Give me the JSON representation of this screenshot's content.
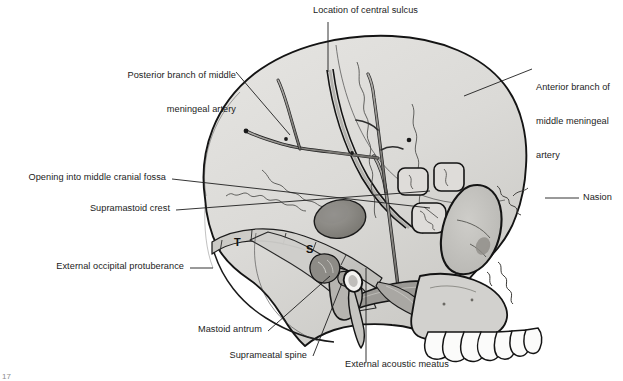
{
  "figure": {
    "width": 623,
    "height": 381,
    "background": "#ffffff",
    "caption_fragment": "17"
  },
  "palette": {
    "bone_fill": "#d9d8d5",
    "bone_fill_light": "#e4e3e0",
    "bone_fill_dark": "#c2c1bd",
    "outline": "#141414",
    "artery": "#9a9894",
    "artery_outline": "#2a2a2a",
    "leader_line": "#1e1e1e",
    "text": "#1b1b1b",
    "tooth_fill": "#fbfbfa",
    "shadow": "#a9a8a4"
  },
  "labels": [
    {
      "id": "location-of-central-sulcus",
      "text": "Location of central sulcus",
      "lines": [
        "Location of central sulcus"
      ],
      "align": "left",
      "x": 313,
      "y": 8,
      "leader": [
        [
          328,
          22
        ],
        [
          328,
          72
        ]
      ]
    },
    {
      "id": "posterior-branch-of-middle-meningeal-artery",
      "text": "Posterior branch of middle meningeal artery",
      "lines": [
        "Posterior branch of middle",
        "meningeal artery"
      ],
      "align": "right",
      "x": 99,
      "y": 50,
      "leader": [
        [
          236,
          72
        ],
        [
          290,
          135
        ]
      ]
    },
    {
      "id": "anterior-branch-of-middle-meningeal-artery",
      "text": "Anterior branch of middle meningeal artery",
      "lines": [
        "Anterior branch of",
        "middle meningeal",
        "artery"
      ],
      "align": "left",
      "x": 536,
      "y": 62,
      "leader": [
        [
          532,
          69
        ],
        [
          464,
          96
        ]
      ]
    },
    {
      "id": "opening-into-middle-cranial-fossa",
      "text": "Opening into middle cranial fossa",
      "lines": [
        "Opening into middle cranial fossa"
      ],
      "align": "right",
      "x": 11,
      "y": 173,
      "leader": [
        [
          172,
          179
        ],
        [
          430,
          208
        ]
      ]
    },
    {
      "id": "supramastoid-crest",
      "text": "Supramastoid crest",
      "lines": [
        "Supramastoid crest"
      ],
      "align": "right",
      "x": 69,
      "y": 204,
      "leader": [
        [
          176,
          210
        ],
        [
          430,
          191
        ]
      ]
    },
    {
      "id": "nasion",
      "text": "Nasion",
      "lines": [
        "Nasion"
      ],
      "align": "left",
      "x": 583,
      "y": 193,
      "leader": [
        [
          579,
          198
        ],
        [
          545,
          198
        ]
      ]
    },
    {
      "id": "external-occipital-protuberance",
      "text": "External occipital protuberance",
      "lines": [
        "External occipital protuberance"
      ],
      "align": "right",
      "x": 33,
      "y": 262,
      "leader": [
        [
          190,
          268
        ],
        [
          213,
          268
        ]
      ]
    },
    {
      "id": "mastoid-antrum",
      "text": "Mastoid antrum",
      "lines": [
        "Mastoid antrum"
      ],
      "align": "right",
      "x": 180,
      "y": 325,
      "leader": [
        [
          268,
          331
        ],
        [
          330,
          276
        ]
      ]
    },
    {
      "id": "suprameatal-spine",
      "text": "Suprameatal spine",
      "lines": [
        "Suprameatal spine"
      ],
      "align": "right",
      "x": 217,
      "y": 351,
      "leader": [
        [
          313,
          356
        ],
        [
          342,
          283
        ]
      ]
    },
    {
      "id": "external-acoustic-meatus",
      "text": "External acoustic meatus",
      "lines": [
        "External acoustic meatus"
      ],
      "align": "left",
      "x": 345,
      "y": 364,
      "leader": [
        [
          366,
          362
        ],
        [
          366,
          268
        ]
      ]
    }
  ],
  "bone_letters": [
    {
      "id": "letter-t",
      "text": "T",
      "x": 234,
      "y": 236
    },
    {
      "id": "letter-s",
      "text": "S",
      "x": 306,
      "y": 243
    }
  ],
  "anatomy": {
    "regions": [
      "cranial-vault",
      "temporal-squama",
      "mastoid-process",
      "zygomatic-arch",
      "orbit",
      "maxilla",
      "upper-teeth",
      "nasal-aperture",
      "external-acoustic-meatus"
    ],
    "arteries": [
      "middle-meningeal-artery-trunk",
      "middle-meningeal-artery-anterior-branch",
      "middle-meningeal-artery-posterior-branch"
    ],
    "tooth_count": 7
  }
}
